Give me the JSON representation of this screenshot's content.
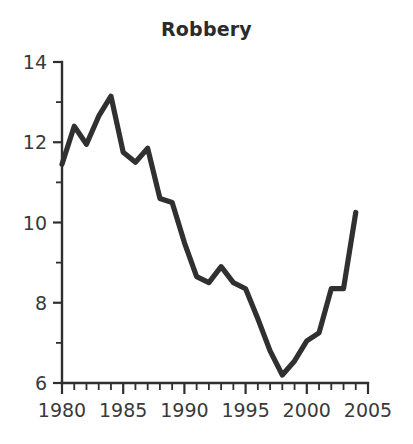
{
  "chart_data": {
    "type": "line",
    "title": "Robbery",
    "xlabel": "",
    "ylabel": "",
    "xlim": [
      1980,
      2005
    ],
    "ylim": [
      6,
      14
    ],
    "grid": false,
    "legend": null,
    "x_ticks_major": [
      1980,
      1985,
      1990,
      1995,
      2000,
      2005
    ],
    "x_tick_labels": [
      "1980",
      "1985",
      "1990",
      "1995",
      "2000",
      "2005"
    ],
    "x_ticks_minor_step": 1,
    "y_ticks_major": [
      6,
      8,
      10,
      12,
      14
    ],
    "y_tick_labels": [
      "6",
      "8",
      "10",
      "12",
      "14"
    ],
    "y_ticks_minor": [
      7,
      9,
      11,
      13
    ],
    "x": [
      1980,
      1981,
      1982,
      1983,
      1984,
      1985,
      1986,
      1987,
      1988,
      1989,
      1990,
      1991,
      1992,
      1993,
      1994,
      1995,
      1996,
      1997,
      1998,
      1999,
      2000,
      2001,
      2002,
      2003,
      2004
    ],
    "values": [
      11.45,
      12.4,
      11.95,
      12.65,
      13.15,
      11.75,
      11.5,
      11.85,
      10.6,
      10.5,
      9.5,
      8.65,
      8.5,
      8.9,
      8.5,
      8.35,
      7.6,
      6.8,
      6.2,
      6.55,
      7.05,
      7.25,
      8.35,
      8.35,
      10.25
    ],
    "series": [
      {
        "name": "Robbery",
        "color": "#303030",
        "values": [
          11.45,
          12.4,
          11.95,
          12.65,
          13.15,
          11.75,
          11.5,
          11.85,
          10.6,
          10.5,
          9.5,
          8.65,
          8.5,
          8.9,
          8.5,
          8.35,
          7.6,
          6.8,
          6.2,
          6.55,
          7.05,
          7.25,
          8.35,
          8.35,
          10.25
        ]
      }
    ],
    "colors": {
      "line": "#303030",
      "axis": "#2f2f2f",
      "text": "#3a3a3a",
      "title": "#2b2b2b",
      "background": "#ffffff"
    }
  }
}
